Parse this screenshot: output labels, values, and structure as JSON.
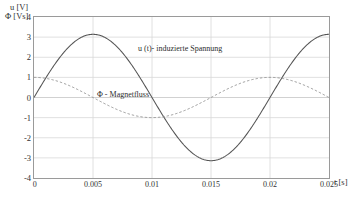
{
  "chart_data": {
    "type": "line",
    "title": "",
    "subtitle": "",
    "xlabel": "t [s]",
    "ylabel_line1": "u [V]",
    "ylabel_line2": "Φ [Vs]",
    "xlim": [
      0,
      0.025
    ],
    "ylim": [
      -4,
      4
    ],
    "grid": true,
    "legend_position": "inline-annotations",
    "xticks": [
      "0",
      "0.005",
      "0.01",
      "0.015",
      "0.02",
      "0.025"
    ],
    "xtick_values": [
      0,
      0.005,
      0.01,
      0.015,
      0.02,
      0.025
    ],
    "yticks": [
      "4",
      "3",
      "2",
      "1",
      "0",
      "-1",
      "-2",
      "-3",
      "-4"
    ],
    "ytick_values": [
      4,
      3,
      2,
      1,
      0,
      -1,
      -2,
      -3,
      -4
    ],
    "annotations": [
      {
        "name": "u-curve-label",
        "text": "u (t)- induzierte Spannung"
      },
      {
        "name": "phi-curve-label",
        "text": "Φ  - Magnetfluss"
      }
    ],
    "series": [
      {
        "name": "u (t)- induzierte Spannung",
        "style": "solid",
        "color": "#555555",
        "amplitude": 3.14,
        "period": 0.02,
        "phase": "sine",
        "x": [
          0,
          0.00125,
          0.0025,
          0.00375,
          0.005,
          0.00625,
          0.0075,
          0.00875,
          0.01,
          0.01125,
          0.0125,
          0.01375,
          0.015,
          0.01625,
          0.0175,
          0.01875,
          0.02,
          0.02125,
          0.0225,
          0.02375,
          0.025
        ],
        "values": [
          0,
          1.2,
          2.22,
          2.9,
          3.14,
          2.9,
          2.22,
          1.2,
          0,
          -1.2,
          -2.22,
          -2.9,
          -3.14,
          -2.9,
          -2.22,
          -1.2,
          0,
          1.2,
          2.22,
          2.9,
          3.14
        ]
      },
      {
        "name": "Φ - Magnetfluss",
        "style": "dashed",
        "color": "#8f8f8f",
        "amplitude": 1.0,
        "period": 0.02,
        "phase": "cosine",
        "x": [
          0,
          0.00125,
          0.0025,
          0.00375,
          0.005,
          0.00625,
          0.0075,
          0.00875,
          0.01,
          0.01125,
          0.0125,
          0.01375,
          0.015,
          0.01625,
          0.0175,
          0.01875,
          0.02,
          0.02125,
          0.0225,
          0.02375,
          0.025
        ],
        "values": [
          1.0,
          0.92,
          0.71,
          0.38,
          0,
          -0.38,
          -0.71,
          -0.92,
          -1.0,
          -0.92,
          -0.71,
          -0.38,
          0,
          0.38,
          0.71,
          0.92,
          1.0,
          0.92,
          0.71,
          0.38,
          0
        ]
      }
    ]
  },
  "colors": {
    "grid": "#d8d8d8",
    "axis": "#9a9a9a",
    "solid_curve": "#555555",
    "dashed_curve": "#8f8f8f",
    "text": "#333333",
    "background": "#ffffff"
  }
}
